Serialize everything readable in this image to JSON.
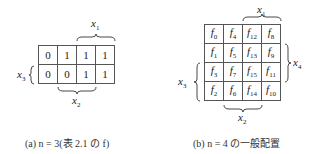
{
  "left": {
    "label_x1": "x",
    "label_x1_sub": "1",
    "label_x2": "x",
    "label_x2_sub": "2",
    "label_x3": "x",
    "label_x3_sub": "3",
    "rows": [
      [
        "0",
        "1",
        "1",
        "1"
      ],
      [
        "0",
        "0",
        "1",
        "1"
      ]
    ],
    "caption": "(a)  n = 3(表 2.1 の f)"
  },
  "right": {
    "label_x1": "x",
    "label_x1_sub": "1",
    "label_x2": "x",
    "label_x2_sub": "2",
    "label_x3": "x",
    "label_x3_sub": "3",
    "label_x4": "x",
    "label_x4_sub": "4",
    "rows": [
      [
        "0",
        "4",
        "12",
        "8"
      ],
      [
        "1",
        "5",
        "13",
        "9"
      ],
      [
        "3",
        "7",
        "15",
        "11"
      ],
      [
        "2",
        "6",
        "14",
        "10"
      ]
    ],
    "cell_symbol": "f",
    "caption": "(b)  n = 4 の一般配置"
  }
}
